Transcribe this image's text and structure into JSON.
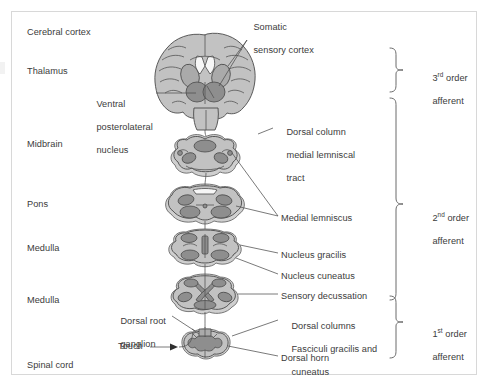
{
  "diagram": {
    "type": "anatomical-schematic",
    "frame_color": "#d8d8d8",
    "fill_light": "#c2c2c2",
    "fill_mid": "#aaaaaa",
    "fill_deep": "#8e8e8e",
    "line_color": "#4d4d4d",
    "text_color": "#3b3b3b"
  },
  "left_labels": [
    {
      "id": "cerebral-cortex",
      "text": "Cerebral cortex",
      "x": 27,
      "y": 27
    },
    {
      "id": "thalamus",
      "text": "Thalamus",
      "x": 27,
      "y": 66
    },
    {
      "id": "midbrain",
      "text": "Midbrain",
      "x": 27,
      "y": 139
    },
    {
      "id": "pons",
      "text": "Pons",
      "x": 27,
      "y": 199
    },
    {
      "id": "medulla-upper",
      "text": "Medulla",
      "x": 27,
      "y": 243
    },
    {
      "id": "medulla-lower",
      "text": "Medulla",
      "x": 27,
      "y": 295
    },
    {
      "id": "spinal-cord",
      "text": "Spinal cord",
      "x": 27,
      "y": 360
    }
  ],
  "callout_labels": [
    {
      "id": "somatic-sensory-cortex",
      "lines": [
        "Somatic",
        "sensory cortex"
      ],
      "x": 243,
      "y": 11,
      "align": "left"
    },
    {
      "id": "ventral-posterolateral-nucleus",
      "lines": [
        "Ventral",
        "posterolateral",
        "nucleus"
      ],
      "x": 86,
      "y": 88,
      "align": "left"
    },
    {
      "id": "dorsal-column-medial-lemniscal-tract",
      "lines": [
        "Dorsal column",
        "medial lemniscal",
        "tract"
      ],
      "x": 276,
      "y": 116,
      "align": "left"
    },
    {
      "id": "medial-lemniscus",
      "lines": [
        "Medial lemniscus"
      ],
      "x": 281,
      "y": 213,
      "align": "left"
    },
    {
      "id": "nucleus-gracilis",
      "lines": [
        "Nucleus gracilis"
      ],
      "x": 281,
      "y": 250,
      "align": "left"
    },
    {
      "id": "nucleus-cuneatus",
      "lines": [
        "Nucleus cuneatus"
      ],
      "x": 281,
      "y": 271,
      "align": "left"
    },
    {
      "id": "sensory-decussation",
      "lines": [
        "Sensory decussation"
      ],
      "x": 281,
      "y": 291,
      "align": "left"
    },
    {
      "id": "dorsal-columns-fasciculi",
      "lines": [
        "Dorsal columns",
        "Fasciculi gracilis and",
        "cuneatus"
      ],
      "x": 281,
      "y": 310,
      "align": "left"
    },
    {
      "id": "dorsal-horn",
      "lines": [
        "Dorsal horn"
      ],
      "x": 281,
      "y": 353,
      "align": "left"
    },
    {
      "id": "dorsal-root-ganglion",
      "lines": [
        "Dorsal root",
        "ganglion"
      ],
      "x": 110,
      "y": 305,
      "align": "left"
    },
    {
      "id": "touch",
      "lines": [
        "Touch"
      ],
      "x": 118,
      "y": 345,
      "align": "left"
    }
  ],
  "bracket_labels": [
    {
      "id": "third-order-afferent",
      "ordinal": "3",
      "suffix": "rd",
      "line1_rest": " order",
      "line2": "afferent",
      "x": 422,
      "y": 62
    },
    {
      "id": "second-order-afferent",
      "ordinal": "2",
      "suffix": "nd",
      "line1_rest": " order",
      "line2": "afferent",
      "x": 422,
      "y": 202
    },
    {
      "id": "first-order-afferent",
      "ordinal": "1",
      "suffix": "st",
      "line1_rest": " order",
      "line2": "afferent",
      "x": 422,
      "y": 318
    }
  ],
  "sections": [
    {
      "id": "brain-coronal-section",
      "name": "cerebral hemispheres coronal section"
    },
    {
      "id": "midbrain-section",
      "name": "midbrain cross section"
    },
    {
      "id": "pons-section",
      "name": "pons cross section"
    },
    {
      "id": "upper-medulla-section",
      "name": "upper medulla cross section"
    },
    {
      "id": "lower-medulla-section",
      "name": "lower medulla cross section"
    },
    {
      "id": "spinal-cord-section",
      "name": "spinal cord cross section"
    }
  ]
}
